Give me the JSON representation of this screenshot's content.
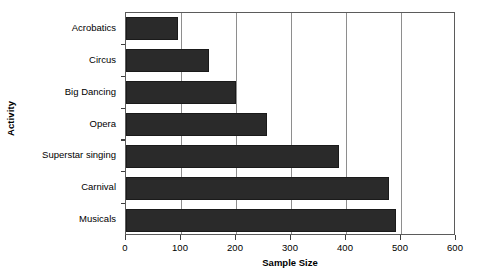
{
  "chart_data": {
    "type": "bar",
    "orientation": "horizontal",
    "title": "",
    "xlabel": "Sample Size",
    "ylabel": "Activity",
    "categories": [
      "Acrobatics",
      "Circus",
      "Big Dancing",
      "Opera",
      "Superstar singing",
      "Carnival",
      "Musicals"
    ],
    "values": [
      95,
      151,
      200,
      256,
      388,
      478,
      490
    ],
    "series": [
      {
        "name": "Sample Size",
        "values": [
          95,
          151,
          200,
          256,
          388,
          478,
          490
        ]
      }
    ],
    "xlim": [
      0,
      600
    ],
    "xticks": [
      0,
      100,
      200,
      300,
      400,
      500,
      600
    ],
    "xtick_labels": [
      "0",
      "100",
      "200",
      "300",
      "400",
      "500",
      "600"
    ],
    "grid": "vertical-only",
    "legend": "none",
    "bar_color": "#2a2a2a",
    "bar_edge_color": "#1a1a1a",
    "axis_color": "#5b5b5b",
    "gridline_color": "#8e8e8e",
    "background_color": "#ffffff"
  }
}
